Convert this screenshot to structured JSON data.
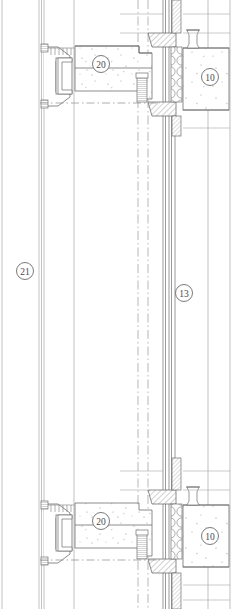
{
  "drawing": {
    "title": "Curtain Wall Facade Section Detail",
    "type": "architectural-section-detail",
    "line_color": "#6b6b6b",
    "thin_line_color": "#9a9a9a",
    "hatch_color": "#8a8a8a",
    "background": "#ffffff",
    "callouts": [
      {
        "id": "callout-20-top",
        "label": "20",
        "x": 101,
        "y": 64,
        "r": 8.5
      },
      {
        "id": "callout-10-top",
        "label": "10",
        "x": 210,
        "y": 77,
        "r": 8.5
      },
      {
        "id": "callout-21",
        "label": "21",
        "x": 25,
        "y": 271,
        "r": 8.5
      },
      {
        "id": "callout-13",
        "label": "13",
        "x": 184,
        "y": 293,
        "r": 8.5
      },
      {
        "id": "callout-20-bottom",
        "label": "20",
        "x": 101,
        "y": 521,
        "r": 8.5
      },
      {
        "id": "callout-10-bottom",
        "label": "10",
        "x": 210,
        "y": 536,
        "r": 8.5
      }
    ],
    "layers": [
      {
        "name": "curtain-wall-mullion",
        "description": "aluminium mullion profile, left"
      },
      {
        "name": "concrete-slab",
        "description": "speckled concrete floor slab"
      },
      {
        "name": "thermal-insulation",
        "description": "circular bubble insulation layer"
      },
      {
        "name": "steel-angle-bracket",
        "description": "diagonal hatched steel member"
      },
      {
        "name": "anchor-bolt",
        "description": "coiled anchor / fixing"
      },
      {
        "name": "centerline",
        "description": "dash-dot axis line"
      },
      {
        "name": "glazing-unit",
        "description": "parallel line glass panel"
      }
    ]
  }
}
